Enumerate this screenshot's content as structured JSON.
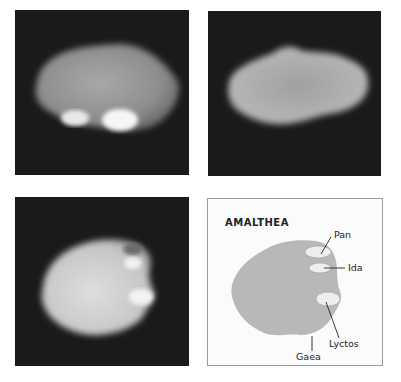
{
  "figure": {
    "panels": [
      {
        "id": "image-1",
        "description": "Amalthea photo, elongated view with bright spots at bottom"
      },
      {
        "id": "image-2",
        "description": "Amalthea photo, elongated lumpy view"
      },
      {
        "id": "image-3",
        "description": "Amalthea photo, rounded view with bright spots on right"
      },
      {
        "id": "map",
        "description": "Schematic map of Amalthea"
      }
    ],
    "map": {
      "title": "AMALTHEA",
      "labels": {
        "pan": "Pan",
        "ida": "Ida",
        "lyctos": "Lyctos",
        "gaea": "Gaea"
      }
    },
    "colors": {
      "background": "#1a1a1a",
      "map_fill": "#b8b8b8",
      "map_spot": "#eeeeee"
    }
  }
}
